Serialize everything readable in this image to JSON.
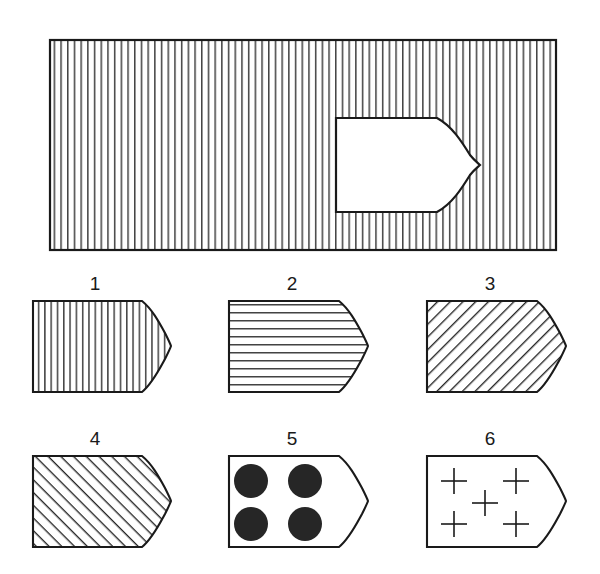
{
  "figure": {
    "title": "",
    "background_color": "#ffffff",
    "line_color": "#1a1a1a",
    "fill_color": "#ffffff",
    "panel_count": 7
  },
  "main_panel": {
    "name": "main-hatched-rectangle",
    "hatch_pattern": "vertical-lines",
    "hatch_spacing_px": 6.7,
    "rect": {
      "x": 50,
      "y": 40,
      "width": 506,
      "height": 210
    },
    "cutout": {
      "name": "arrow-shaped-cutout",
      "fill": "white",
      "left": 336,
      "top": 118,
      "bottom": 212,
      "tip_x": 480,
      "tip_y": 165,
      "shoulder_x": 437
    }
  },
  "shapes": [
    {
      "number": "1",
      "label": "1",
      "pattern": "vertical-lines",
      "pattern_name": "vertical-hatch",
      "label_x": 95,
      "label_y": 288
    },
    {
      "number": "2",
      "label": "2",
      "pattern": "horizontal-lines",
      "pattern_name": "horizontal-hatch",
      "label_x": 292,
      "label_y": 288
    },
    {
      "number": "3",
      "label": "3",
      "pattern": "diagonal-lines-up",
      "pattern_name": "diagonal-hatch-forward-slash",
      "label_x": 490,
      "label_y": 288
    },
    {
      "number": "4",
      "label": "4",
      "pattern": "diagonal-lines-down",
      "pattern_name": "diagonal-hatch-backslash",
      "label_x": 95,
      "label_y": 443
    },
    {
      "number": "5",
      "label": "5",
      "pattern": "filled-dots",
      "pattern_name": "four-black-dots",
      "dot_count": 4,
      "dot_radius": 17,
      "label_x": 292,
      "label_y": 443
    },
    {
      "number": "6",
      "label": "6",
      "pattern": "cross-marks",
      "pattern_name": "five-plus-signs",
      "cross_count": 5,
      "cross_size": 13,
      "label_x": 490,
      "label_y": 443
    }
  ],
  "colors": {
    "ink": "#1a1a1a",
    "paper": "#ffffff",
    "dot_fill": "#262626"
  }
}
